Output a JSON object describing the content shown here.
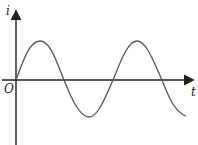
{
  "diagram": {
    "type": "sinusoid-graph",
    "y_axis_label": "i",
    "x_axis_label": "t",
    "origin_label": "O",
    "curve": "i = sin(ωt), starts at origin increasing, ~1.75 periods shown",
    "colors": {
      "axis": "#222222",
      "curve": "#555555",
      "background": "#ffffff"
    }
  }
}
